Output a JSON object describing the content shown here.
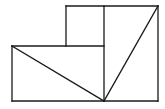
{
  "diagram": {
    "title": "",
    "stroke_color": "#1a1a1a",
    "background_color": "#ffffff",
    "points": {
      "A": [
        12,
        46
      ],
      "B": [
        66,
        46
      ],
      "C": [
        66,
        6
      ],
      "D": [
        104,
        6
      ],
      "E": [
        158,
        6
      ],
      "F": [
        158,
        101
      ],
      "G": [
        104,
        101
      ],
      "H": [
        12,
        101
      ]
    },
    "segments": [
      {
        "id": "left-edge",
        "from": "A",
        "to": "H"
      },
      {
        "id": "bottom-edge",
        "from": "H",
        "to": "F"
      },
      {
        "id": "right-edge",
        "from": "E",
        "to": "F"
      },
      {
        "id": "top-edge",
        "from": "C",
        "to": "E"
      },
      {
        "id": "mid-horizontal",
        "from": "A",
        "to": "G_top"
      },
      {
        "id": "top-box-left",
        "from": "C",
        "to": "B"
      },
      {
        "id": "center-vertical",
        "from": "D",
        "to": "G"
      },
      {
        "id": "diagonal-left",
        "from": "A",
        "to": "G"
      },
      {
        "id": "diagonal-right",
        "from": "E",
        "to": "G"
      }
    ]
  }
}
